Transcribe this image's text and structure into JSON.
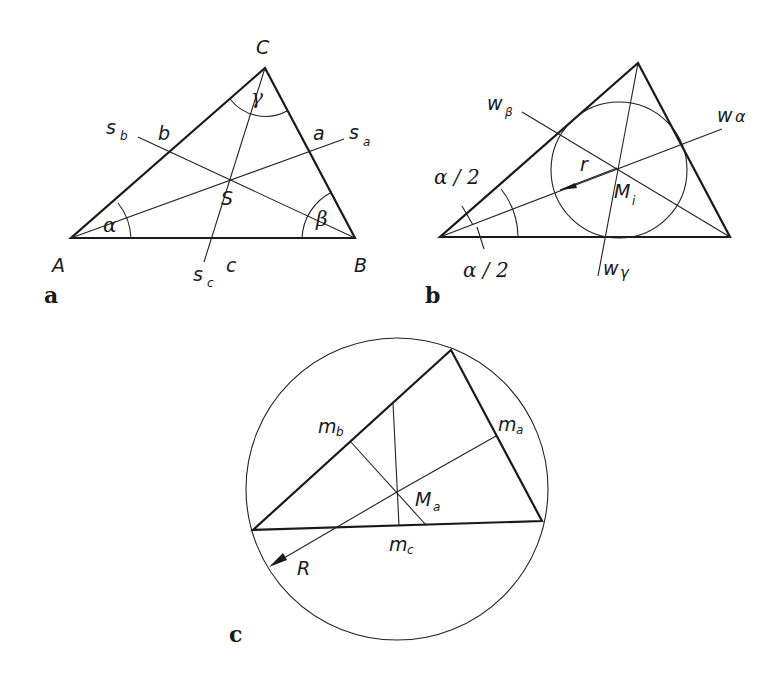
{
  "figure": {
    "panels": [
      {
        "id": "a",
        "label": "a",
        "title": "Centroid (medians)",
        "vertices": {
          "A": "A",
          "B": "B",
          "C": "C"
        },
        "sides": {
          "a": "a",
          "b": "b",
          "c": "c"
        },
        "angles": {
          "alpha": "α",
          "beta": "β",
          "gamma": "γ"
        },
        "medians": {
          "sa": "s",
          "sa_sub": "a",
          "sb": "s",
          "sb_sub": "b",
          "sc": "s",
          "sc_sub": "c"
        },
        "center": "S"
      },
      {
        "id": "b",
        "label": "b",
        "title": "Incircle (angle bisectors)",
        "bisectors": {
          "wa": "w",
          "wa_sub": "α",
          "wb": "w",
          "wb_sub": "β",
          "wc": "w",
          "wc_sub": "γ"
        },
        "half_angle_top": "α / 2",
        "half_angle_bottom": "α / 2",
        "radius": "r",
        "center": "M",
        "center_sub": "i"
      },
      {
        "id": "c",
        "label": "c",
        "title": "Circumcircle (perpendicular bisectors)",
        "perp_bisectors": {
          "ma": "m",
          "ma_sub": "a",
          "mb": "m",
          "mb_sub": "b",
          "mc": "m",
          "mc_sub": "c"
        },
        "radius": "R",
        "center": "M",
        "center_sub": "a"
      }
    ]
  }
}
